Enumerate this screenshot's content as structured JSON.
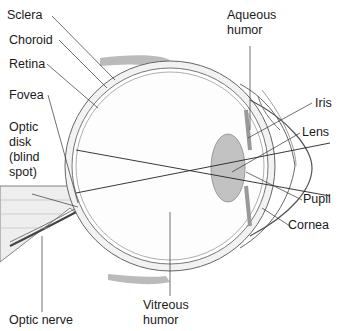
{
  "diagram": {
    "labels": {
      "sclera": "Sclera",
      "choroid": "Choroid",
      "retina": "Retina",
      "fovea": "Fovea",
      "optic_disk": "Optic\ndisk\n(blind\nspot)",
      "optic_nerve": "Optic nerve",
      "aqueous_humor": "Aqueous\nhumor",
      "iris": "Iris",
      "lens": "Lens",
      "pupil": "Pupil",
      "cornea": "Cornea",
      "vitreous_humor": "Vitreous\nhumor"
    },
    "colors": {
      "outline": "#555555",
      "sclera_fill": "#e6e6e6",
      "lens_fill": "#bdbdbd",
      "leader": "#222222"
    }
  }
}
